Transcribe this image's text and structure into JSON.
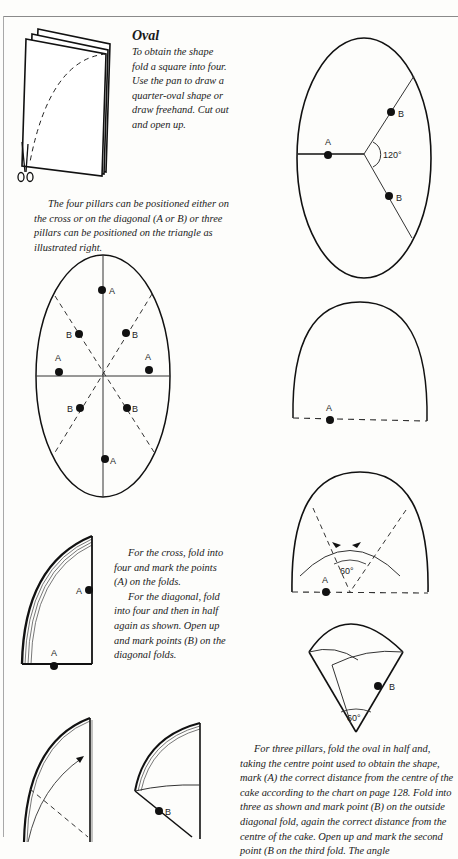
{
  "section": {
    "heading": "Oval",
    "intro": "To obtain the shape fold a square into four. Use the pan to draw a quarter-oval shape or draw freehand. Cut out and open up."
  },
  "pillars_note": "The four pillars can be positioned either on the cross or on the diagonal (A or B) or three pillars can be positioned on the triangle as illustrated right.",
  "cross_instructions": {
    "para1": "For the cross, fold into four and mark the points (A) on the folds.",
    "para2": "For the diagonal, fold into four and then in half again as shown. Open up and mark points (B) on the diagonal folds."
  },
  "three_pillars_instructions": "For three pillars, fold the oval in half and, taking the centre point used to obtain the shape, mark (A) the correct distance from the centre of the cake according to the chart on page 128. Fold into three as shown and mark point (B) on the outside diagonal fold, again the correct distance from the centre of the cake. Open up and mark the second point (B on the third fold. The angle",
  "diagram_labels": {
    "point_a": "A",
    "point_b": "B",
    "angle_120": "120°",
    "angle_60": "60°"
  },
  "colors": {
    "ink": "#111111",
    "paper": "#fdfdfb",
    "frame": "#8a8a8a"
  }
}
